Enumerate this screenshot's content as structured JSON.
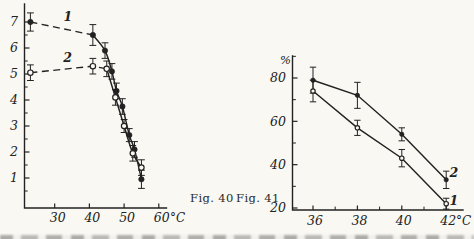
{
  "page": {
    "background": "#f9f8f3",
    "ink": "#222222"
  },
  "captions": {
    "fig40": "Fig. 40",
    "fig41": "Fig. 41"
  },
  "chart_data": [
    {
      "id": "fig40",
      "type": "line",
      "title": "Fig. 40",
      "xlabel": "",
      "ylabel": "",
      "x_unit": "°C",
      "y_unit": "",
      "xlim": [
        21,
        62
      ],
      "ylim": [
        0,
        7.7
      ],
      "grid": false,
      "legend_position": "on-curve",
      "x_ticks": [
        {
          "v": 30,
          "label": "30"
        },
        {
          "v": 40,
          "label": "40"
        },
        {
          "v": 50,
          "label": "50"
        },
        {
          "v": 60,
          "label": "60"
        }
      ],
      "x_minor": [],
      "y_ticks": [
        {
          "v": 1,
          "label": "1"
        },
        {
          "v": 2,
          "label": "2"
        },
        {
          "v": 3,
          "label": "3"
        },
        {
          "v": 4,
          "label": "4"
        },
        {
          "v": 5,
          "label": "5"
        },
        {
          "v": 6,
          "label": "6"
        },
        {
          "v": 7,
          "label": "7"
        }
      ],
      "y_minor": [
        0.5,
        1.5,
        2.5,
        3.5,
        4.5,
        5.5,
        6.5
      ],
      "series": [
        {
          "name": "1",
          "marker": "filled-circle",
          "line_style": "dashed-then-solid",
          "dash_until": 1,
          "smooth": true,
          "points": [
            [
              23,
              7.0
            ],
            [
              41,
              6.5
            ],
            [
              44.5,
              5.9
            ],
            [
              46.5,
              5.1
            ],
            [
              47.8,
              4.35
            ],
            [
              49.5,
              3.75
            ],
            [
              51.5,
              2.65
            ],
            [
              53,
              2.1
            ],
            [
              55,
              0.95
            ]
          ],
          "err": [
            0.35,
            0.4,
            0.3,
            0.3,
            0.3,
            0.3,
            0.25,
            0.3,
            0.35
          ],
          "label": {
            "text": "1",
            "x": 33.8,
            "y": 7.2
          }
        },
        {
          "name": "2",
          "marker": "open-circle",
          "line_style": "dashed-then-solid",
          "dash_until": 2,
          "smooth": true,
          "points": [
            [
              23,
              5.05
            ],
            [
              41,
              5.3
            ],
            [
              45,
              5.2
            ],
            [
              47.5,
              4.1
            ],
            [
              50,
              3.0
            ],
            [
              52.5,
              1.95
            ],
            [
              55,
              1.4
            ]
          ],
          "err": [
            0.3,
            0.3,
            0.3,
            0.3,
            0.25,
            0.3,
            0.3
          ],
          "label": {
            "text": "2",
            "x": 33.7,
            "y": 5.62
          }
        }
      ]
    },
    {
      "id": "fig41",
      "type": "line",
      "title": "Fig. 41",
      "xlabel": "",
      "ylabel": "%",
      "x_unit": "°C",
      "y_unit": "%",
      "xlim": [
        35,
        43
      ],
      "ylim": [
        19,
        90
      ],
      "grid": false,
      "legend_position": "on-curve",
      "x_ticks": [
        {
          "v": 36,
          "label": "36"
        },
        {
          "v": 38,
          "label": "38"
        },
        {
          "v": 40,
          "label": "40"
        },
        {
          "v": 42,
          "label": "42"
        }
      ],
      "x_minor": [
        37,
        39,
        41
      ],
      "y_ticks": [
        {
          "v": 20,
          "label": "20"
        },
        {
          "v": 40,
          "label": "40"
        },
        {
          "v": 60,
          "label": "60"
        },
        {
          "v": 80,
          "label": "80"
        }
      ],
      "y_minor": [
        30,
        50,
        70,
        90
      ],
      "series": [
        {
          "name": "2",
          "marker": "filled-circle",
          "line_style": "solid",
          "dash_until": 0,
          "smooth": false,
          "points": [
            [
              36,
              79
            ],
            [
              38,
              72
            ],
            [
              40,
              54
            ],
            [
              42,
              33
            ]
          ],
          "err": [
            6,
            6,
            3,
            4
          ],
          "label": {
            "text": "2",
            "x": 42.35,
            "y": 36
          }
        },
        {
          "name": "1",
          "marker": "open-circle",
          "line_style": "solid",
          "dash_until": 0,
          "smooth": false,
          "points": [
            [
              36,
              74
            ],
            [
              38,
              57
            ],
            [
              40,
              43
            ],
            [
              42,
              22
            ]
          ],
          "err": [
            5,
            3.5,
            4,
            2.5
          ],
          "label": {
            "text": "1",
            "x": 42.35,
            "y": 23
          }
        }
      ]
    }
  ]
}
